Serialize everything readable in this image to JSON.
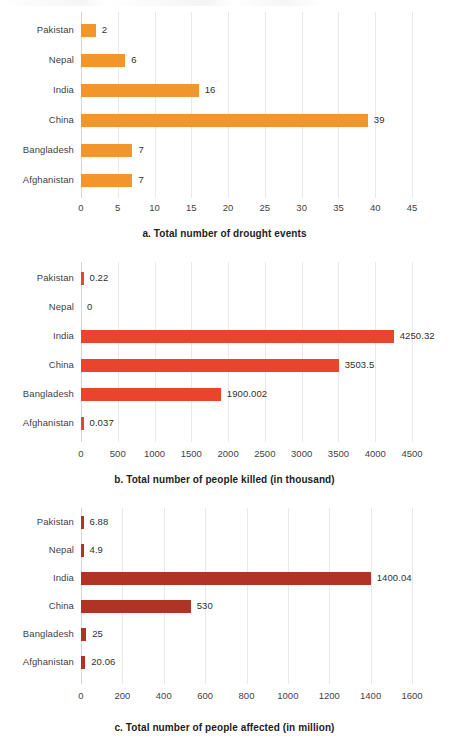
{
  "figure": {
    "background_color": "#ffffff",
    "grid_color": "#e9e9ec",
    "axis_color": "#d5d5d8"
  },
  "charts": [
    {
      "id": "a",
      "caption": "a. Total number of drought events",
      "bar_color": "#F0962D",
      "chart_data": {
        "type": "bar",
        "orientation": "horizontal",
        "title": "a. Total number of drought events",
        "xlabel": "",
        "ylabel": "",
        "categories": [
          "Pakistan",
          "Nepal",
          "India",
          "China",
          "Bangladesh",
          "Afghanistan"
        ],
        "values": [
          2,
          6,
          16,
          39,
          7,
          7
        ],
        "value_labels": [
          "2",
          "6",
          "16",
          "39",
          "7",
          "7"
        ],
        "xlim": [
          0,
          45
        ],
        "xticks": [
          0,
          5,
          10,
          15,
          20,
          25,
          30,
          35,
          40,
          45
        ],
        "xtick_labels": [
          "0",
          "5",
          "10",
          "15",
          "20",
          "25",
          "30",
          "35",
          "40",
          "45"
        ],
        "grid": true,
        "legend": false
      }
    },
    {
      "id": "b",
      "caption": "b. Total number of people killed (in thousand)",
      "bar_color": "#E8452C",
      "chart_data": {
        "type": "bar",
        "orientation": "horizontal",
        "title": "b. Total number of people killed (in thousand)",
        "xlabel": "",
        "ylabel": "",
        "categories": [
          "Pakistan",
          "Nepal",
          "India",
          "China",
          "Bangladesh",
          "Afghanistan"
        ],
        "values": [
          0.22,
          0,
          4250.32,
          3503.5,
          1900.002,
          0.037
        ],
        "value_labels": [
          "0.22",
          "0",
          "4250.32",
          "3503.5",
          "1900.002",
          "0.037"
        ],
        "xlim": [
          0,
          4500
        ],
        "xticks": [
          0,
          500,
          1000,
          1500,
          2000,
          2500,
          3000,
          3500,
          4000,
          4500
        ],
        "xtick_labels": [
          "0",
          "500",
          "1000",
          "1500",
          "2000",
          "2500",
          "3000",
          "3500",
          "4000",
          "4500"
        ],
        "grid": true,
        "legend": false
      }
    },
    {
      "id": "c",
      "caption": "c. Total number of people affected (in million)",
      "bar_color": "#B03425",
      "chart_data": {
        "type": "bar",
        "orientation": "horizontal",
        "title": "c. Total number of people affected (in million)",
        "xlabel": "",
        "ylabel": "",
        "categories": [
          "Pakistan",
          "Nepal",
          "India",
          "China",
          "Bangladesh",
          "Afghanistan"
        ],
        "values": [
          6.88,
          4.9,
          1400.04,
          530,
          25,
          20.06
        ],
        "value_labels": [
          "6.88",
          "4.9",
          "1400.04",
          "530",
          "25",
          "20.06"
        ],
        "xlim": [
          0,
          1600
        ],
        "xticks": [
          0,
          200,
          400,
          600,
          800,
          1000,
          1200,
          1400,
          1600
        ],
        "xtick_labels": [
          "0",
          "200",
          "400",
          "600",
          "800",
          "1000",
          "1200",
          "1400",
          "1600"
        ],
        "grid": true,
        "legend": false
      }
    }
  ]
}
